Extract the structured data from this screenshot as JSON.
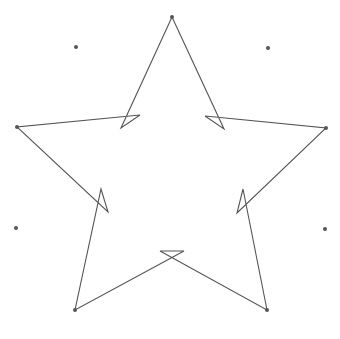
{
  "diagram": {
    "type": "star-outline",
    "stroke_color": "#555555",
    "dot_color": "#555555",
    "background": "#ffffff",
    "star_path_points": [
      [
        172,
        17
      ],
      [
        121,
        128
      ],
      [
        140,
        115
      ],
      [
        17,
        127
      ],
      [
        108,
        212
      ],
      [
        101,
        189
      ],
      [
        75,
        310
      ],
      [
        184,
        251
      ],
      [
        160,
        251
      ],
      [
        267,
        310
      ],
      [
        243,
        189
      ],
      [
        237,
        213
      ],
      [
        326,
        128
      ],
      [
        205,
        116
      ],
      [
        224,
        129
      ],
      [
        172,
        17
      ]
    ],
    "vertex_dots": [
      [
        172,
        17
      ],
      [
        17,
        127
      ],
      [
        326,
        128
      ],
      [
        75,
        310
      ],
      [
        267,
        310
      ]
    ],
    "free_dots": [
      [
        76,
        47
      ],
      [
        268,
        48
      ],
      [
        16,
        228
      ],
      [
        325,
        229
      ]
    ]
  }
}
